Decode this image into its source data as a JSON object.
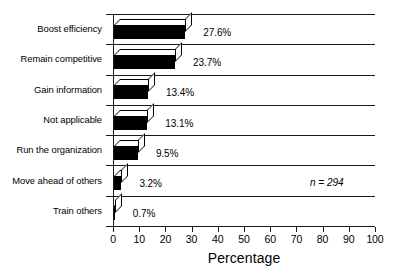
{
  "chart_data": {
    "type": "bar",
    "orientation": "horizontal",
    "style": "3d",
    "title": "",
    "xlabel": "Percentage",
    "ylabel": "",
    "xlim": [
      0,
      100
    ],
    "xticks": [
      0,
      10,
      20,
      30,
      40,
      50,
      60,
      70,
      80,
      90,
      100
    ],
    "xtick_labels": [
      "0",
      "10",
      "20",
      "30",
      "40",
      "50",
      "60",
      "70",
      "80",
      "90",
      "100"
    ],
    "grid": "horizontal-band-separators",
    "legend": "none",
    "bar_color": "#000000",
    "categories": [
      "Boost efficiency",
      "Remain competitive",
      "Gain information",
      "Not applicable",
      "Run the organization",
      "Move ahead of others",
      "Train others"
    ],
    "values": [
      27.6,
      23.7,
      13.4,
      13.1,
      9.5,
      3.2,
      0.7
    ],
    "data_labels": [
      "27.6%",
      "23.7%",
      "13.4%",
      "13.1%",
      "9.5%",
      "3.2%",
      "0.7%"
    ],
    "annotations": [
      {
        "text": "n = 294",
        "category": "Move ahead of others",
        "style": "italic"
      }
    ]
  },
  "axis": {
    "x_title": "Percentage"
  },
  "annotation": {
    "sample_size": "n = 294"
  },
  "title_remnant": ""
}
